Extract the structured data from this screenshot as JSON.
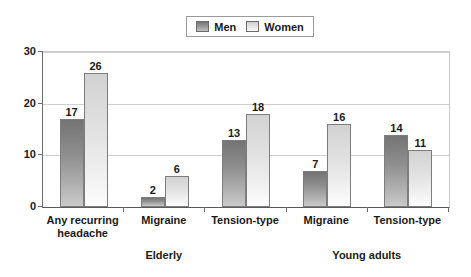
{
  "chart_data": {
    "type": "bar",
    "title": "",
    "subtitle": "",
    "xlabel": "",
    "ylabel": "",
    "ylim": [
      0,
      30
    ],
    "ytick_values": [
      0,
      10,
      20,
      30
    ],
    "ytick_labels": [
      "0",
      "10",
      "20",
      "30"
    ],
    "grid": true,
    "legend_position": "top-center",
    "categories": [
      "Any recurring headache",
      "Migraine",
      "Tension-type",
      "Migraine",
      "Tension-type"
    ],
    "category_lines": [
      [
        "Any recurring",
        "headache"
      ],
      [
        "Migraine"
      ],
      [
        "Tension-type"
      ],
      [
        "Migraine"
      ],
      [
        "Tension-type"
      ]
    ],
    "groups": [
      {
        "label": "Elderly",
        "categories": [
          0,
          1,
          2
        ]
      },
      {
        "label": "Young adults",
        "categories": [
          3,
          4
        ]
      }
    ],
    "series": [
      {
        "name": "Men",
        "color": "#8e8e8e",
        "values": [
          17,
          2,
          13,
          7,
          14
        ]
      },
      {
        "name": "Women",
        "color": "#e2e2e2",
        "values": [
          26,
          6,
          18,
          16,
          11
        ]
      }
    ]
  },
  "legend": {
    "entries": [
      {
        "label": "Men",
        "swatch": "men-swatch-icon"
      },
      {
        "label": "Women",
        "swatch": "women-swatch-icon"
      }
    ]
  },
  "colors": {
    "men_dark": "#747474",
    "men_light": "#cacaca",
    "women_dark": "#d2d2d2",
    "women_light": "#fdfdfd",
    "axis": "#6e6e6e",
    "grid": "#cfcfcf",
    "text": "#1a1a1a",
    "background": "#ffffff"
  }
}
